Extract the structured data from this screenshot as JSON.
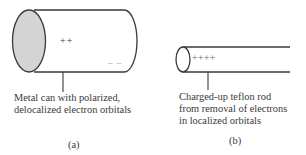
{
  "figure": {
    "panel_a": {
      "label": "(a)",
      "charge_top": "++",
      "charge_bottom": "– –",
      "caption_lines": [
        "Metal can with polarized,",
        "delocalized electron orbitals"
      ]
    },
    "panel_b": {
      "label": "(b)",
      "charge": "++++",
      "caption_lines": [
        "Charged-up teflon rod",
        "from removal of electrons",
        "in localized orbitals"
      ]
    },
    "colors": {
      "stroke": "#3a3a3a",
      "end_fill": "#d4d4d4",
      "text": "#3a3a3a"
    }
  }
}
